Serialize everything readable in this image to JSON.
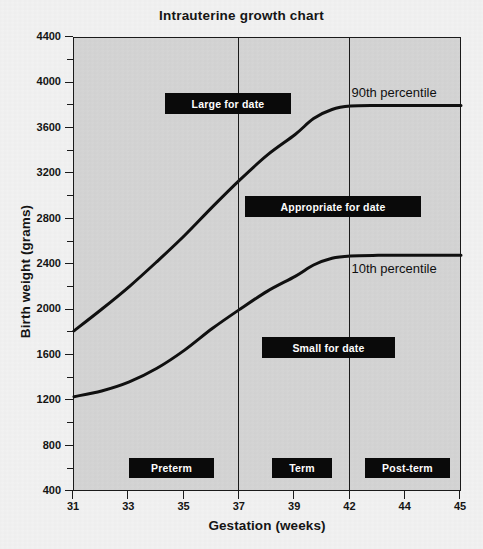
{
  "chart_data": {
    "type": "line",
    "title": "Intrauterine growth chart",
    "xlabel": "Gestation (weeks)",
    "ylabel": "Birth weight (grams)",
    "xlim": [
      31,
      45
    ],
    "ylim": [
      400,
      4400
    ],
    "x_tick_labels": [
      "31",
      "33",
      "35",
      "37",
      "39",
      "42",
      "44",
      "45"
    ],
    "y_tick_labels": [
      "400",
      "800",
      "1200",
      "1600",
      "2000",
      "2400",
      "2800",
      "3200",
      "3600",
      "4000",
      "4400"
    ],
    "y_major_step": 400,
    "y_minor_step": 200,
    "grid": false,
    "legend": "inline-labels",
    "series": [
      {
        "name": "90th percentile",
        "label_x_week": 42,
        "points": [
          {
            "week": 31,
            "grams": 1820
          },
          {
            "week": 32,
            "grams": 2010
          },
          {
            "week": 33,
            "grams": 2210
          },
          {
            "week": 34,
            "grams": 2430
          },
          {
            "week": 35,
            "grams": 2660
          },
          {
            "week": 36,
            "grams": 2910
          },
          {
            "week": 37,
            "grams": 3150
          },
          {
            "week": 38,
            "grams": 3370
          },
          {
            "week": 39,
            "grams": 3550
          },
          {
            "week": 40,
            "grams": 3690
          },
          {
            "week": 41,
            "grams": 3770
          },
          {
            "week": 42,
            "grams": 3800
          },
          {
            "week": 43,
            "grams": 3805
          },
          {
            "week": 44,
            "grams": 3805
          },
          {
            "week": 45,
            "grams": 3805
          }
        ]
      },
      {
        "name": "10th percentile",
        "label_x_week": 42,
        "points": [
          {
            "week": 31,
            "grams": 1240
          },
          {
            "week": 32,
            "grams": 1290
          },
          {
            "week": 33,
            "grams": 1370
          },
          {
            "week": 34,
            "grams": 1490
          },
          {
            "week": 35,
            "grams": 1650
          },
          {
            "week": 36,
            "grams": 1840
          },
          {
            "week": 37,
            "grams": 2010
          },
          {
            "week": 38,
            "grams": 2170
          },
          {
            "week": 39,
            "grams": 2300
          },
          {
            "week": 40,
            "grams": 2400
          },
          {
            "week": 41,
            "grams": 2460
          },
          {
            "week": 42,
            "grams": 2480
          },
          {
            "week": 43,
            "grams": 2485
          },
          {
            "week": 44,
            "grams": 2485
          },
          {
            "week": 45,
            "grams": 2485
          }
        ]
      }
    ],
    "zone_dividers": [
      37,
      42
    ],
    "annotations": [
      {
        "id": "large-for-date",
        "text": "Large for date",
        "x": 165,
        "y": 93,
        "w": 126,
        "h": 21
      },
      {
        "id": "appropriate-for-date",
        "text": "Appropriate for date",
        "x": 245,
        "y": 196,
        "w": 176,
        "h": 21
      },
      {
        "id": "small-for-date",
        "text": "Small for date",
        "x": 262,
        "y": 337,
        "w": 133,
        "h": 21
      },
      {
        "id": "preterm",
        "text": "Preterm",
        "x": 129,
        "y": 458,
        "w": 85,
        "h": 20
      },
      {
        "id": "term",
        "text": "Term",
        "x": 272,
        "y": 458,
        "w": 60,
        "h": 20
      },
      {
        "id": "post-term",
        "text": "Post-term",
        "x": 365,
        "y": 458,
        "w": 85,
        "h": 20
      }
    ],
    "colors": {
      "plot_background": "#d5d5d5",
      "page_background": "#f2f2f2",
      "axis": "#1a1a1a",
      "curve": "#101010",
      "callout_background": "#0a0a0a",
      "callout_text": "#ffffff"
    }
  }
}
